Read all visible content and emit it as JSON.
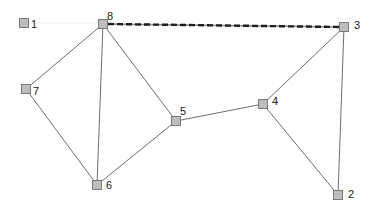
{
  "diagram": {
    "type": "undirected-graph",
    "colors": {
      "background": "#ffffff",
      "edge": "#6e6e6e",
      "highlight_edge": "#1e1e1e",
      "node_fill": "#bdbdbd",
      "node_stroke": "#7a7a7a",
      "label": "#222222"
    },
    "nodes": [
      {
        "id": "1",
        "label": "1",
        "x": 24,
        "y": 23
      },
      {
        "id": "2",
        "label": "2",
        "x": 338,
        "y": 195
      },
      {
        "id": "3",
        "label": "3",
        "x": 344,
        "y": 27
      },
      {
        "id": "4",
        "label": "4",
        "x": 263,
        "y": 104
      },
      {
        "id": "5",
        "label": "5",
        "x": 176,
        "y": 121
      },
      {
        "id": "6",
        "label": "6",
        "x": 97,
        "y": 185
      },
      {
        "id": "7",
        "label": "7",
        "x": 26,
        "y": 89
      },
      {
        "id": "8",
        "label": "8",
        "x": 103,
        "y": 24
      }
    ],
    "edges": [
      {
        "from": "8",
        "to": "3",
        "style": "dashed-bold"
      },
      {
        "from": "8",
        "to": "7",
        "style": "solid"
      },
      {
        "from": "8",
        "to": "6",
        "style": "solid"
      },
      {
        "from": "8",
        "to": "5",
        "style": "solid"
      },
      {
        "from": "7",
        "to": "6",
        "style": "solid"
      },
      {
        "from": "6",
        "to": "5",
        "style": "solid"
      },
      {
        "from": "5",
        "to": "4",
        "style": "solid"
      },
      {
        "from": "4",
        "to": "3",
        "style": "solid"
      },
      {
        "from": "4",
        "to": "2",
        "style": "solid"
      },
      {
        "from": "3",
        "to": "2",
        "style": "solid"
      },
      {
        "from": "1",
        "to": "8",
        "style": "faint"
      }
    ],
    "labels": {
      "n1": "1",
      "n2": "2",
      "n3": "3",
      "n4": "4",
      "n5": "5",
      "n6": "6",
      "n7": "7",
      "n8": "8"
    }
  }
}
